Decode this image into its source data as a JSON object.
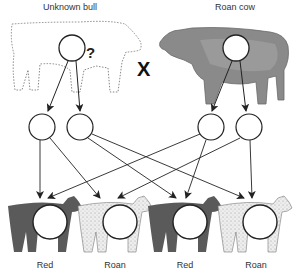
{
  "parents": {
    "bull": {
      "label": "Unknown bull",
      "genotype_marker": "?"
    },
    "cross_symbol": "X",
    "cow": {
      "label": "Roan cow"
    }
  },
  "offspring": [
    {
      "label": "Red",
      "pattern": "solid"
    },
    {
      "label": "Roan",
      "pattern": "speckled"
    },
    {
      "label": "Red",
      "pattern": "solid"
    },
    {
      "label": "Roan",
      "pattern": "speckled"
    }
  ],
  "colors": {
    "red_calf": "#5a5a5a",
    "roan_calf": "#e8e8e8",
    "line": "#333333"
  }
}
